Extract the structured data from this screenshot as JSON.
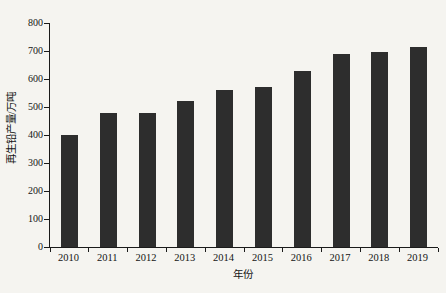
{
  "figure": {
    "background_color": "#f5f4f0",
    "bar_color": "#2d2d2d",
    "axis_color": "#1a1a1a",
    "text_color": "#141414"
  },
  "chart_data": {
    "type": "bar",
    "xlabel": "年份",
    "ylabel": "再生铅产量/万吨",
    "categories": [
      "2010",
      "2011",
      "2012",
      "2013",
      "2014",
      "2015",
      "2016",
      "2017",
      "2018",
      "2019"
    ],
    "values": [
      400,
      480,
      480,
      520,
      560,
      570,
      630,
      690,
      695,
      715
    ],
    "ylim": [
      0,
      800
    ],
    "yticks": [
      0,
      100,
      200,
      300,
      400,
      500,
      600,
      700,
      800
    ],
    "grid": false,
    "legend": "none",
    "tick_style": "x ticks at category boundaries, y ticks outside left axis"
  }
}
